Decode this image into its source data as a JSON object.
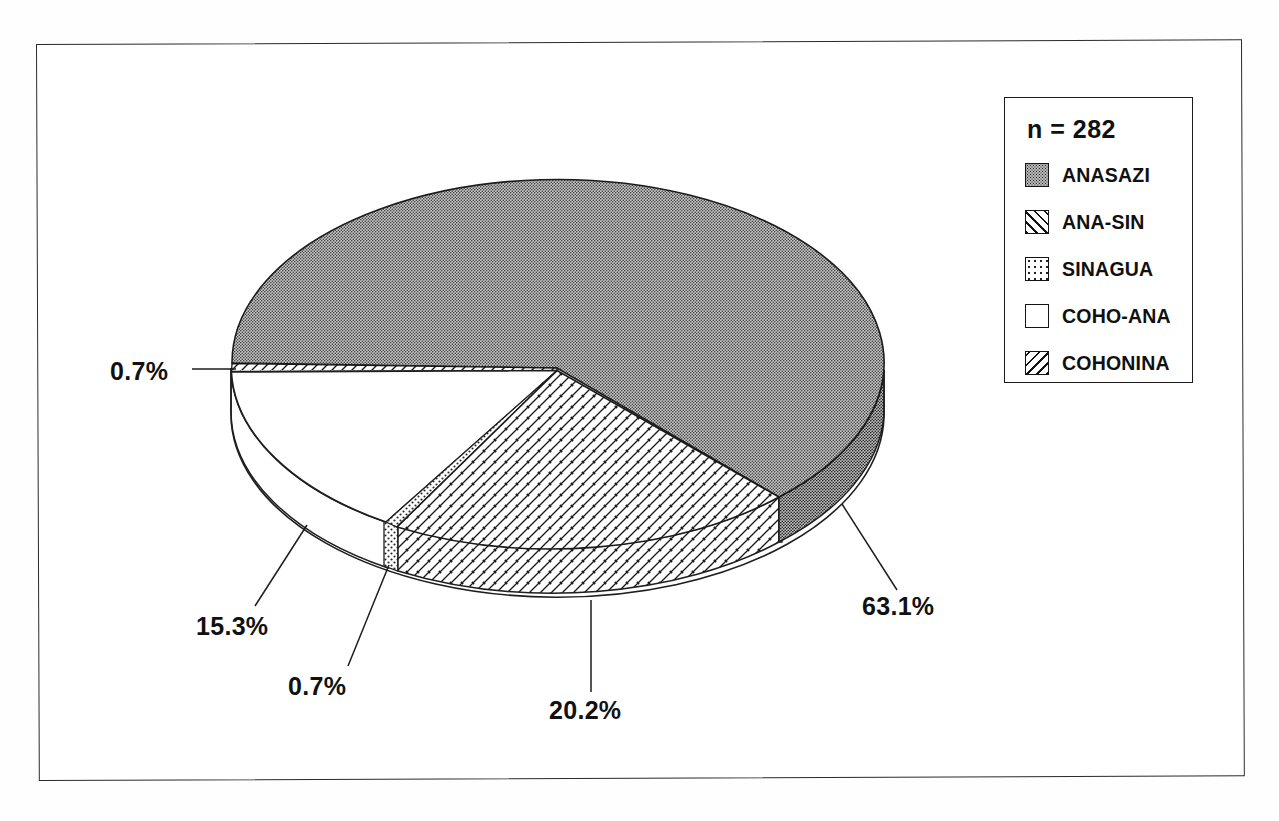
{
  "figure": {
    "border_color": "#2b2b2b",
    "background": "#ffffff"
  },
  "legend": {
    "count_label": "n = 282",
    "items": [
      {
        "label": "ANASAZI",
        "pattern": "dense-stipple",
        "swatch_class": "sw-stipple-dense"
      },
      {
        "label": "ANA-SIN",
        "pattern": "diagonal-hatch-up",
        "swatch_class": "sw-hatch-up"
      },
      {
        "label": "SINAGUA",
        "pattern": "sparse-stipple",
        "swatch_class": "sw-stipple-sparse"
      },
      {
        "label": "COHO-ANA",
        "pattern": "solid-white",
        "swatch_class": "sw-white"
      },
      {
        "label": "COHONINA",
        "pattern": "diagonal-hatch-down",
        "swatch_class": "sw-hatch-down"
      }
    ]
  },
  "callouts": [
    {
      "name": "callout-cohonina",
      "text": "0.7%",
      "left": 110,
      "top": 357
    },
    {
      "name": "callout-coho-ana",
      "text": "15.3%",
      "left": 196,
      "top": 612
    },
    {
      "name": "callout-sinagua",
      "text": "0.7%",
      "left": 288,
      "top": 672
    },
    {
      "name": "callout-ana-sin",
      "text": "20.2%",
      "left": 549,
      "top": 696
    },
    {
      "name": "callout-anasazi",
      "text": "63.1%",
      "left": 862,
      "top": 592
    }
  ],
  "chart_data": {
    "type": "pie",
    "title": "",
    "subtitle": "",
    "xlabel": "",
    "ylabel": "",
    "total_n": 282,
    "units": "percent",
    "three_d": true,
    "legend_position": "top-right",
    "grid": false,
    "categories": [
      "ANASAZI",
      "ANA-SIN",
      "SINAGUA",
      "COHO-ANA",
      "COHONINA"
    ],
    "values": [
      63.1,
      20.2,
      0.7,
      15.3,
      0.7
    ],
    "labels": [
      "63.1%",
      "20.2%",
      "0.7%",
      "15.3%",
      "0.7%"
    ],
    "counts": [
      178,
      57,
      2,
      43,
      2
    ],
    "slices": [
      {
        "name": "ANASAZI",
        "percent": 63.1,
        "label": "63.1%",
        "fill": "dense-stipple"
      },
      {
        "name": "ANA-SIN",
        "percent": 20.2,
        "label": "20.2%",
        "fill": "diagonal-hatch-up"
      },
      {
        "name": "SINAGUA",
        "percent": 0.7,
        "label": "0.7%",
        "fill": "sparse-stipple"
      },
      {
        "name": "COHO-ANA",
        "percent": 15.3,
        "label": "15.3%",
        "fill": "solid-white"
      },
      {
        "name": "COHONINA",
        "percent": 0.7,
        "label": "0.7%",
        "fill": "diagonal-hatch-down"
      }
    ]
  }
}
